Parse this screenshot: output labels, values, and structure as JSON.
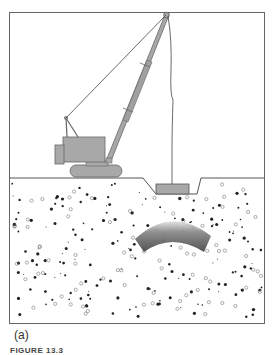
{
  "figure": {
    "panel_label": "(a)",
    "caption": "FIGURE 13.3",
    "colors": {
      "frame": "#555555",
      "crane_fill": "#a8a8a8",
      "crane_stroke": "#555555",
      "cable": "#333333",
      "soil_background": "#ffffff",
      "particle_filled": "#222222",
      "particle_hollow": "#777777",
      "compaction_zone_dark": "#4a4a4a",
      "compaction_zone_light": "#dcdcdc"
    },
    "elements": {
      "crane": "crane",
      "boom": "boom",
      "tamper": "tamper",
      "crater": "crater",
      "compaction_zone": "compaction-zone",
      "soil": "soil"
    }
  }
}
